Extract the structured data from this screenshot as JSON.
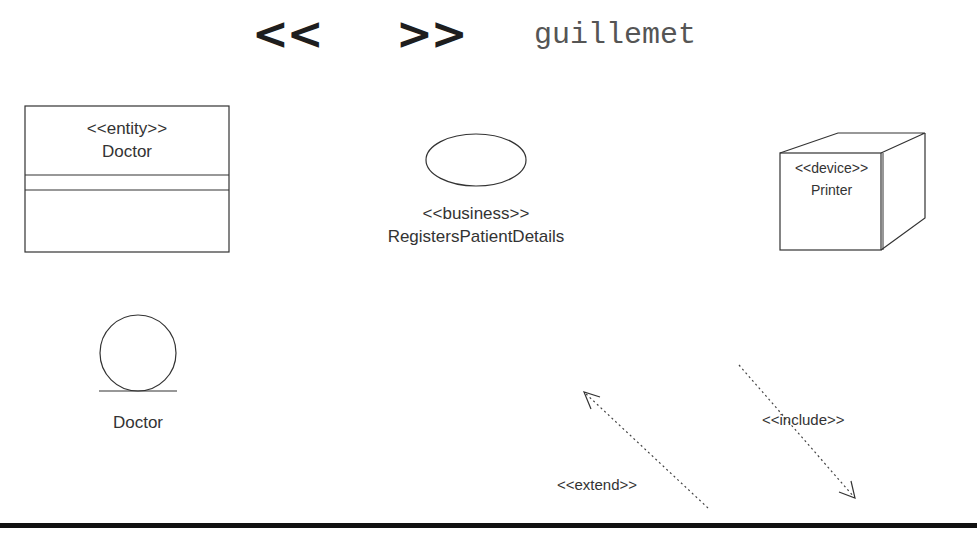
{
  "header": {
    "left_guillemet": "<<",
    "right_guillemet": ">>",
    "caption": "guillemet"
  },
  "entity_class": {
    "stereotype": "<<entity>>",
    "name": "Doctor"
  },
  "use_case": {
    "stereotype": "<<business>>",
    "name": "RegistersPatientDetails"
  },
  "device_node": {
    "stereotype": "<<device>>",
    "name": "Printer"
  },
  "entity_icon": {
    "name": "Doctor"
  },
  "relationships": [
    {
      "stereotype": "<<extend>>",
      "direction": "up-left"
    },
    {
      "stereotype": "<<include>>",
      "direction": "down-right"
    }
  ],
  "colors": {
    "line": "#333333",
    "text": "#333333",
    "guillemet": "#1e1e1e",
    "caption": "#555555",
    "rule": "#111111"
  }
}
